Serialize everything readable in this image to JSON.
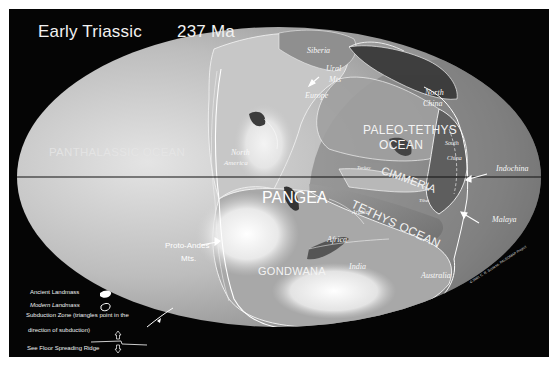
{
  "title": {
    "era": "Early Triassic",
    "age": "237 Ma"
  },
  "map": {
    "projection": "mollweide-ellipse",
    "equator_line": true,
    "oceans": [
      {
        "id": "panthalassic",
        "label": "PANTHALASSIC OCEAN"
      },
      {
        "id": "paleo-tethys",
        "label_line1": "PALEO-TETHYS",
        "label_line2": "OCEAN"
      },
      {
        "id": "tethys",
        "label": "TETHYS OCEAN"
      }
    ],
    "landmasses": [
      {
        "id": "pangea",
        "label": "PANGEA"
      },
      {
        "id": "gondwana",
        "label": "GONDWANA"
      },
      {
        "id": "cimmeria",
        "label": "CIMMERIA"
      }
    ],
    "places": {
      "siberia": "Siberia",
      "ural_mts_line1": "Ural",
      "ural_mts_line2": "Mts",
      "europe": "Europe",
      "north_china_line1": "North",
      "north_china_line2": "China",
      "south_china_line1": "South",
      "south_china_line2": "China",
      "indochina": "Indochina",
      "malaya": "Malaya",
      "north_america_line1": "North",
      "north_america_line2": "America",
      "africa": "Africa",
      "arabia": "Arabia",
      "india": "India",
      "australia": "Australia",
      "turkey": "Turkey",
      "tibet": "Tibet",
      "proto_andes_line1": "Proto-Andes",
      "proto_andes_line2": "Mts."
    },
    "copyright": "© 2001 C. R. Scotese, PALEOMAP Project"
  },
  "legend": {
    "ancient_landmass": "Ancient Landmass",
    "modern_landmass": "Modern Landmass",
    "subduction_line1": "Subduction Zone (triangles point in the",
    "subduction_line2": "direction of subduction)",
    "ridge": "See Floor Spreading Ridge"
  },
  "colors": {
    "background": "#050505",
    "ocean_light": "#d8d8d8",
    "ocean_dark": "#6a6a6a",
    "land_highlight": "#ffffff",
    "coastline": "#f5f5f5",
    "equator": "#111111"
  }
}
